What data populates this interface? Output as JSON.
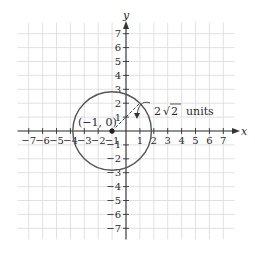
{
  "chart_data": {
    "type": "scatter",
    "title": "",
    "xlabel": "x",
    "ylabel": "y",
    "xlim": [
      -7,
      7
    ],
    "ylim": [
      -7,
      7
    ],
    "grid": true,
    "x_ticks": [
      -7,
      -6,
      -5,
      -4,
      -3,
      -2,
      -1,
      1,
      2,
      3,
      4,
      5,
      6,
      7
    ],
    "y_ticks": [
      -7,
      -6,
      -5,
      -4,
      -3,
      -2,
      -1,
      1,
      2,
      3,
      4,
      5,
      6,
      7
    ],
    "x_tick_labels": [
      "−7",
      "−6",
      "−5",
      "−4",
      "−3",
      "−2",
      "−1",
      "1",
      "2",
      "3",
      "4",
      "5",
      "6",
      "7"
    ],
    "y_tick_labels": [
      "−7",
      "−6",
      "−5",
      "−4",
      "−3",
      "−2",
      "−1",
      "1",
      "2",
      "3",
      "4",
      "5",
      "6",
      "7"
    ],
    "shapes": [
      {
        "kind": "circle",
        "center": [
          -1,
          0
        ],
        "radius": 2.8284
      }
    ],
    "points": [
      {
        "x": -1,
        "y": 0,
        "label": "(−1, 0)"
      }
    ],
    "annotations": [
      {
        "kind": "dashed-radius",
        "from": [
          -1,
          0
        ],
        "to": [
          1,
          2
        ]
      },
      {
        "kind": "text",
        "text": "2 √2  units",
        "points_to": "radius"
      }
    ]
  },
  "labels": {
    "x_axis": "x",
    "y_axis": "y",
    "center_label": "(−1, 0)",
    "radius_label_coef": "2",
    "radius_label_root": "2",
    "radius_label_units": "units"
  }
}
